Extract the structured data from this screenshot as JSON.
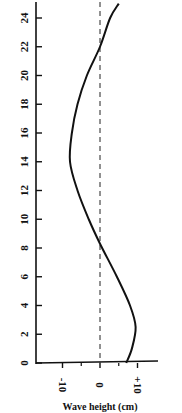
{
  "chart_data": {
    "type": "line",
    "title": "",
    "orientation": "rotated (y-axis vertical on left, values horizontal)",
    "xlabel": "Wave height (cm)",
    "ylabel": "",
    "x_ticks": [
      "-10",
      "0",
      "+10"
    ],
    "y_ticks": [
      "0",
      "2",
      "4",
      "6",
      "8",
      "10",
      "12",
      "14",
      "16",
      "18",
      "20",
      "22",
      "24"
    ],
    "xlim": [
      -17,
      17
    ],
    "ylim": [
      0,
      25
    ],
    "grid": false,
    "reference_line": {
      "value": 0,
      "style": "dashed",
      "orientation": "vertical"
    },
    "series": [
      {
        "name": "profile",
        "points": [
          {
            "pos": 0,
            "value": 7
          },
          {
            "pos": 1,
            "value": 8.5
          },
          {
            "pos": 2.5,
            "value": 9.5
          },
          {
            "pos": 4,
            "value": 8
          },
          {
            "pos": 6,
            "value": 4.5
          },
          {
            "pos": 8.3,
            "value": 0
          },
          {
            "pos": 10,
            "value": -3
          },
          {
            "pos": 12,
            "value": -6
          },
          {
            "pos": 14,
            "value": -8
          },
          {
            "pos": 16,
            "value": -7.5
          },
          {
            "pos": 18,
            "value": -6
          },
          {
            "pos": 20,
            "value": -3.5
          },
          {
            "pos": 22,
            "value": 0
          },
          {
            "pos": 24,
            "value": 2.7
          },
          {
            "pos": 25,
            "value": 5
          }
        ]
      }
    ],
    "legend": null
  },
  "labels": {
    "xlabel": "Wave height (cm)"
  }
}
